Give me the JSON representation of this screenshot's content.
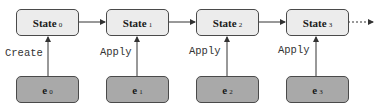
{
  "diagram": {
    "type": "event-sourcing-state-chain",
    "states": [
      {
        "label": "State",
        "sub": "0"
      },
      {
        "label": "State",
        "sub": "1"
      },
      {
        "label": "State",
        "sub": "2"
      },
      {
        "label": "State",
        "sub": "3"
      }
    ],
    "events": [
      {
        "label": "e",
        "sub": "0"
      },
      {
        "label": "e",
        "sub": "1"
      },
      {
        "label": "e",
        "sub": "2"
      },
      {
        "label": "e",
        "sub": "3"
      }
    ],
    "edge_labels": [
      "Create",
      "Apply",
      "Apply",
      "Apply"
    ],
    "continuation": "dashed-arrow",
    "colors": {
      "state_fill": "#ececec",
      "event_fill": "#a9a9a9",
      "stroke": "#4a4a4a"
    }
  }
}
